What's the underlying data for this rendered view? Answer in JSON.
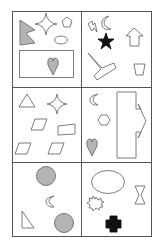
{
  "colors": {
    "stroke": "#6e6e6e",
    "gray_fill": "#b4b4b4",
    "black_fill": "#111111",
    "grid": "#555555"
  },
  "grid": {
    "rows": 3,
    "columns": 2,
    "left": 12,
    "right": 151,
    "top": 11,
    "bottom": 236,
    "col_split": 81,
    "row_splits": [
      87,
      162
    ]
  },
  "cells": [
    {
      "id": "r1c1",
      "shapes": [
        "gray-notched-triangle",
        "four-point-star",
        "pentagon",
        "ellipse",
        "rectangle",
        "gray-heart"
      ]
    },
    {
      "id": "r1c2",
      "shapes": [
        "lightning-bolt",
        "crescent",
        "black-star",
        "up-arrow",
        "v-shape",
        "trapezoid"
      ]
    },
    {
      "id": "r2c1",
      "shapes": [
        "triangle",
        "four-point-star",
        "parallelogram",
        "quadrilateral",
        "parallelogram",
        "parallelogram"
      ]
    },
    {
      "id": "r2c2",
      "shapes": [
        "crescent",
        "hexagon",
        "gray-heart",
        "right-arrow-block"
      ]
    },
    {
      "id": "r3c1",
      "shapes": [
        "gray-circle",
        "crescent",
        "right-triangle",
        "gray-circle"
      ]
    },
    {
      "id": "r3c2",
      "shapes": [
        "ellipse",
        "hourglass",
        "starburst",
        "black-cross"
      ]
    }
  ]
}
